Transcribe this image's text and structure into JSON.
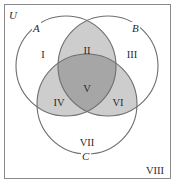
{
  "diagram": {
    "type": "venn-3-set",
    "universe_label": "U",
    "sets": [
      {
        "name": "A",
        "label": "A"
      },
      {
        "name": "B",
        "label": "B"
      },
      {
        "name": "C",
        "label": "C"
      }
    ],
    "regions": [
      {
        "id": "I",
        "label": "I",
        "description": "A only"
      },
      {
        "id": "II",
        "label": "II",
        "description": "A and B, not C"
      },
      {
        "id": "III",
        "label": "III",
        "description": "B only"
      },
      {
        "id": "IV",
        "label": "IV",
        "description": "A and C, not B"
      },
      {
        "id": "V",
        "label": "V",
        "description": "A and B and C"
      },
      {
        "id": "VI",
        "label": "VI",
        "description": "B and C, not A"
      },
      {
        "id": "VII",
        "label": "VII",
        "description": "C only"
      },
      {
        "id": "VIII",
        "label": "VIII",
        "description": "outside A, B, C"
      }
    ],
    "colors": {
      "background": "#ffffff",
      "frame": "#8a8a8a",
      "circle_stroke": "#6e6e6e",
      "pairwise_fill": "#cdcdcd",
      "triple_fill": "#a6a6a6"
    }
  }
}
